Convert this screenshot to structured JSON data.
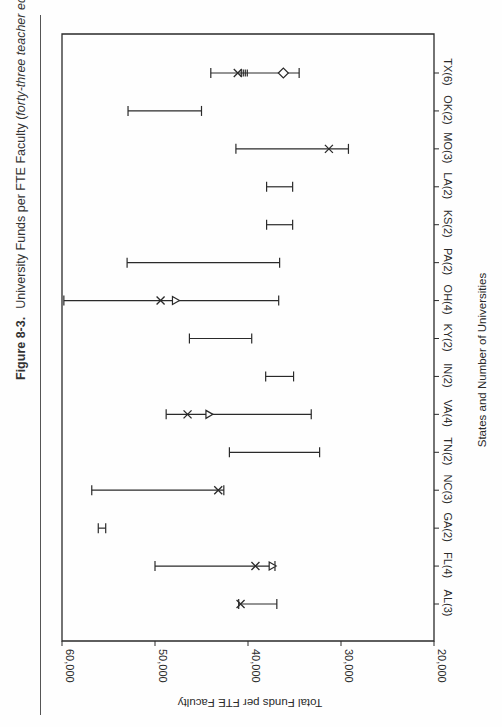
{
  "caption": {
    "figure_label": "Figure 8-3.",
    "title": "University Funds per FTE Faculty (",
    "subtitle": "forty-three teacher education programs in fifteen states",
    "close": ")."
  },
  "chart_data": {
    "type": "range-dot",
    "orientation": "rotated 90° clockwise (value axis horizontal, 60,000 at left to 20,000 at right)",
    "title": "University Funds per FTE Faculty (forty-three teacher education programs in fifteen states)",
    "xlabel": "States and Number of Universities",
    "ylabel": "Total Funds per FTE Faculty",
    "ylim": [
      20000,
      60000
    ],
    "yticks": [
      "20,000",
      "30,000",
      "40,000",
      "50,000",
      "60,000"
    ],
    "grid": false,
    "categories": [
      "AL(3)",
      "FL(4)",
      "GA(2)",
      "NC(3)",
      "TN(2)",
      "VA(4)",
      "IN(2)",
      "KY(2)",
      "OH(4)",
      "PA(2)",
      "KS(2)",
      "LA(2)",
      "MO(3)",
      "OK(2)",
      "TX(6)"
    ],
    "series": [
      {
        "name": "max",
        "values": [
          41000,
          50000,
          56100,
          56800,
          42000,
          48800,
          38100,
          46300,
          59800,
          53000,
          38000,
          38000,
          41300,
          52900,
          44000
        ]
      },
      {
        "name": "min",
        "values": [
          36900,
          37100,
          55300,
          42600,
          32300,
          33200,
          35100,
          39600,
          36700,
          36600,
          35200,
          35200,
          29200,
          45000,
          34500
        ]
      },
      {
        "name": "x-marker",
        "values": [
          40800,
          39200,
          null,
          43200,
          null,
          46500,
          null,
          null,
          49400,
          null,
          null,
          null,
          31300,
          null,
          41100
        ]
      },
      {
        "name": "triangle-marker",
        "values": [
          null,
          37400,
          null,
          null,
          null,
          44200,
          null,
          null,
          47800,
          null,
          null,
          null,
          null,
          null,
          null
        ]
      },
      {
        "name": "diamond-marker",
        "values": [
          null,
          null,
          null,
          null,
          null,
          null,
          null,
          null,
          null,
          null,
          null,
          null,
          null,
          null,
          36200
        ]
      },
      {
        "name": "cluster-marker",
        "values": [
          null,
          null,
          null,
          null,
          null,
          null,
          null,
          null,
          null,
          null,
          null,
          null,
          null,
          null,
          40400
        ]
      }
    ]
  },
  "colors": {
    "ink": "#2a2a2a",
    "background": "#fefefe"
  }
}
